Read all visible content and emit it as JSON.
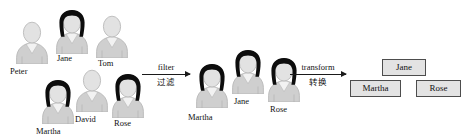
{
  "diagram": {
    "colors": {
      "body_fill": "#cfcfcf",
      "body_stroke": "#b3b3b3",
      "head_fill": "#e2e2e2",
      "hair_dark": "#0d0d0d",
      "collar_fill": "#f2f2f2",
      "box_fill": "#e3e3e3",
      "box_stroke": "#4d4d4d",
      "arrow_color": "#1a1a1a",
      "text_color": "#111111",
      "background": "#ffffff"
    },
    "stage_source": {
      "name": "source-collection",
      "people": [
        {
          "id": "peter",
          "label": "Peter",
          "hair": "light",
          "x": 12,
          "y": 18,
          "scale": 1.0,
          "label_x": 10,
          "label_y": 66
        },
        {
          "id": "jane",
          "label": "Jane",
          "hair": "dark",
          "x": 52,
          "y": 8,
          "scale": 1.0,
          "label_x": 57,
          "label_y": 53
        },
        {
          "id": "tom",
          "label": "Tom",
          "hair": "light",
          "x": 92,
          "y": 12,
          "scale": 1.0,
          "label_x": 98,
          "label_y": 58
        },
        {
          "id": "martha",
          "label": "Martha",
          "hair": "dark",
          "x": 38,
          "y": 78,
          "scale": 1.0,
          "label_x": 36,
          "label_y": 126
        },
        {
          "id": "david",
          "label": "David",
          "hair": "light",
          "x": 72,
          "y": 66,
          "scale": 1.0,
          "label_x": 75,
          "label_y": 114
        },
        {
          "id": "rose",
          "label": "Rose",
          "hair": "dark",
          "x": 108,
          "y": 72,
          "scale": 1.0,
          "label_x": 114,
          "label_y": 118
        }
      ]
    },
    "arrow_filter": {
      "name": "filter-arrow",
      "label_top": "filter",
      "label_bottom": "过滤",
      "x": 142,
      "y": 62,
      "width": 48
    },
    "stage_filtered": {
      "name": "filtered-collection",
      "people": [
        {
          "id": "martha",
          "label": "Martha",
          "hair": "dark",
          "x": 192,
          "y": 62,
          "scale": 1.0,
          "label_x": 188,
          "label_y": 112
        },
        {
          "id": "jane",
          "label": "Jane",
          "hair": "dark",
          "x": 228,
          "y": 48,
          "scale": 1.0,
          "label_x": 234,
          "label_y": 96
        },
        {
          "id": "rose",
          "label": "Rose",
          "hair": "dark",
          "x": 264,
          "y": 56,
          "scale": 1.0,
          "label_x": 270,
          "label_y": 104
        }
      ]
    },
    "arrow_transform": {
      "name": "transform-arrow",
      "label_top": "transform",
      "label_bottom": "转换",
      "x": 290,
      "y": 62,
      "width": 56
    },
    "stage_result": {
      "name": "result-collection",
      "boxes": [
        {
          "id": "jane",
          "label": "Jane",
          "x": 382,
          "y": 59,
          "width": 44,
          "height": 17
        },
        {
          "id": "martha",
          "label": "Martha",
          "x": 350,
          "y": 80,
          "width": 51,
          "height": 17
        },
        {
          "id": "rose",
          "label": "Rose",
          "x": 416,
          "y": 80,
          "width": 45,
          "height": 17
        }
      ]
    }
  }
}
